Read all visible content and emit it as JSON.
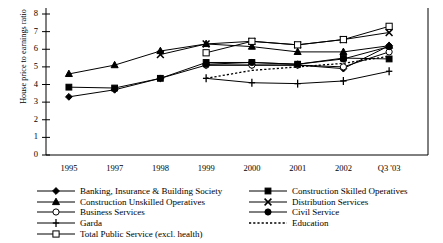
{
  "chart_data": {
    "type": "line",
    "title": "",
    "xlabel": "",
    "ylabel": "House price to earnings ratio",
    "categories": [
      "1995",
      "1997",
      "1998",
      "1999",
      "2000",
      "2001",
      "2002",
      "Q3 '03"
    ],
    "ylim": [
      0,
      8
    ],
    "yticks": [
      "0",
      "1",
      "2",
      "3",
      "4",
      "5",
      "6",
      "7",
      "8"
    ],
    "grid": false,
    "legend_position": "bottom",
    "series": [
      {
        "name": "Banking, Insurance & Building Society",
        "marker": "filled-diamond",
        "line": "solid",
        "values": [
          3.3,
          3.7,
          4.35,
          5.1,
          5.1,
          5.1,
          4.9,
          6.2
        ]
      },
      {
        "name": "Construction Skilled Operatives",
        "marker": "filled-square",
        "line": "solid",
        "values": [
          3.85,
          3.8,
          4.35,
          5.25,
          5.25,
          5.15,
          5.5,
          5.45
        ]
      },
      {
        "name": "Construction Unskilled Operatives",
        "marker": "filled-triangle",
        "line": "solid",
        "values": [
          4.6,
          5.1,
          5.9,
          6.3,
          6.15,
          5.85,
          5.85,
          6.2
        ]
      },
      {
        "name": "Distribution Services",
        "marker": "cross-x",
        "line": "solid",
        "values": [
          null,
          null,
          5.7,
          6.3,
          6.45,
          6.25,
          6.55,
          6.95
        ]
      },
      {
        "name": "Business Services",
        "marker": "open-circle",
        "line": "solid",
        "values": [
          null,
          null,
          null,
          5.1,
          5.1,
          5.1,
          5.0,
          5.85
        ]
      },
      {
        "name": "Civil Service",
        "marker": "filled-circle",
        "line": "solid",
        "values": [
          null,
          null,
          null,
          5.15,
          5.25,
          5.15,
          5.45,
          6.15
        ]
      },
      {
        "name": "Garda",
        "marker": "plus",
        "line": "solid",
        "values": [
          null,
          null,
          null,
          4.35,
          4.1,
          4.05,
          4.2,
          4.75
        ]
      },
      {
        "name": "Education",
        "marker": "none",
        "line": "dotted",
        "values": [
          null,
          null,
          null,
          4.35,
          4.8,
          5.0,
          5.2,
          5.6
        ]
      },
      {
        "name": "Total Public Service (excl. health)",
        "marker": "open-square",
        "line": "solid",
        "values": [
          null,
          null,
          null,
          5.8,
          6.45,
          6.25,
          6.55,
          7.3
        ]
      }
    ]
  },
  "legend": {
    "left_column": [
      "Banking, Insurance & Building Society",
      "Construction Unskilled Operatives",
      "Business Services",
      "Garda",
      "Total Public Service (excl. health)"
    ],
    "right_column": [
      "Construction Skilled Operatives",
      "Distribution Services",
      "Civil Service",
      "Education"
    ]
  }
}
